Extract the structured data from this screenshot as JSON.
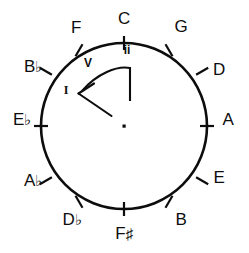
{
  "diagram": {
    "stroke_color": "#0d0d0d",
    "background_color": "#ffffff",
    "center": {
      "x": 124,
      "y": 126
    },
    "radius": 83,
    "center_dot_label": "·",
    "notes": [
      {
        "name": "C",
        "label": "C",
        "accidental": "",
        "angle_deg": 0,
        "lx": 124,
        "ly": 18,
        "anchor": "center"
      },
      {
        "name": "G",
        "label": "G",
        "accidental": "",
        "angle_deg": 30,
        "lx": 181,
        "ly": 26,
        "anchor": "center"
      },
      {
        "name": "D",
        "label": "D",
        "accidental": "",
        "angle_deg": 60,
        "lx": 219,
        "ly": 69,
        "anchor": "center"
      },
      {
        "name": "A",
        "label": "A",
        "accidental": "",
        "angle_deg": 90,
        "lx": 228,
        "ly": 119,
        "anchor": "center"
      },
      {
        "name": "E",
        "label": "E",
        "accidental": "",
        "angle_deg": 120,
        "lx": 219,
        "ly": 177,
        "anchor": "center"
      },
      {
        "name": "B",
        "label": "B",
        "accidental": "",
        "angle_deg": 150,
        "lx": 181,
        "ly": 219,
        "anchor": "center"
      },
      {
        "name": "Fs",
        "label": "F",
        "accidental": "♯",
        "angle_deg": 180,
        "lx": 124,
        "ly": 232,
        "anchor": "center"
      },
      {
        "name": "Db",
        "label": "D",
        "accidental": "♭",
        "angle_deg": 210,
        "lx": 72,
        "ly": 219,
        "anchor": "center"
      },
      {
        "name": "Ab",
        "label": "A",
        "accidental": "♭",
        "angle_deg": 240,
        "lx": 33,
        "ly": 180,
        "anchor": "center"
      },
      {
        "name": "Eb",
        "label": "E",
        "accidental": "♭",
        "angle_deg": 270,
        "lx": 22,
        "ly": 119,
        "anchor": "center"
      },
      {
        "name": "Bb",
        "label": "B",
        "accidental": "♭",
        "angle_deg": 300,
        "lx": 33,
        "ly": 66,
        "anchor": "center"
      },
      {
        "name": "F",
        "label": "F",
        "accidental": "",
        "angle_deg": 330,
        "lx": 76,
        "ly": 27,
        "anchor": "center"
      }
    ],
    "romans": [
      {
        "name": "ii",
        "text": "ii",
        "x": 127,
        "y": 50,
        "style": "sans"
      },
      {
        "name": "V",
        "text": "V",
        "x": 88,
        "y": 63,
        "style": "sans"
      },
      {
        "name": "I",
        "text": "I",
        "x": 66,
        "y": 90,
        "style": "serif"
      }
    ],
    "annotation": {
      "name": "progression-arrow",
      "description": "curved arrow from ii through V to I",
      "pointer_line": {
        "x1": 130,
        "y1": 68,
        "x2": 130,
        "y2": 101
      },
      "curve_path": "M 130 68 C 118 66 98 74 82 91",
      "arrow_head": "M 79 93 L 93 84 M 79 93 L 111 116"
    }
  }
}
